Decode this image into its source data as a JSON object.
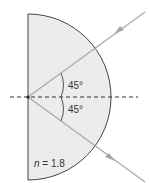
{
  "diagram": {
    "angle_upper": "45°",
    "angle_lower": "45°",
    "index_var": "n",
    "index_rest": " = 1.8",
    "colors": {
      "fill": "#ececec",
      "outline": "#444444",
      "ray": "#a8a8a8",
      "dash": "#333333"
    }
  }
}
